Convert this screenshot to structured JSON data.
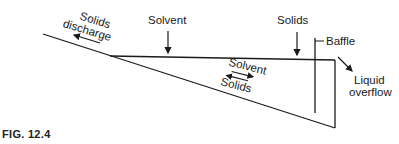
{
  "figure": {
    "caption": "FIG. 12.4",
    "labels": {
      "solids_discharge_1": "Solids",
      "solids_discharge_2": "discharge",
      "solvent_in": "Solvent",
      "solids_in": "Solids",
      "baffle": "Baffle",
      "liquid_overflow_1": "Liquid",
      "liquid_overflow_2": "overflow",
      "flow_solvent": "Solvent",
      "flow_solids": "Solids"
    },
    "colors": {
      "line": "#1a1a1a",
      "background": "#ffffff"
    }
  }
}
